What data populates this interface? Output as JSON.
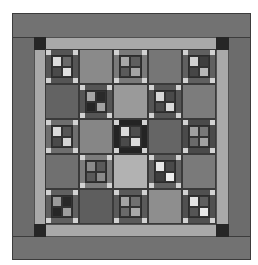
{
  "quilt": {
    "colors": {
      "outer_border": "#6f6f6f",
      "sashing": "#a9a9a9",
      "corner": "#262626",
      "corner_square": "#d2d2d2"
    },
    "blocks": [
      [
        {
          "type": "fourpatch",
          "frame": "#555555",
          "cells": [
            "#dcdcdc",
            "#6a6a6a",
            "#4a4a4a",
            "#e0e0e0"
          ]
        },
        {
          "type": "plain",
          "fill": "#8a8a8a"
        },
        {
          "type": "fourpatch",
          "frame": "#7a7a7a",
          "cells": [
            "#a8a8a8",
            "#5e5e5e",
            "#5a5a5a",
            "#a4a4a4"
          ]
        },
        {
          "type": "plain",
          "fill": "#767676"
        },
        {
          "type": "fourpatch",
          "frame": "#606060",
          "cells": [
            "#d2d2d2",
            "#3e3e3e",
            "#464646",
            "#b8b8b8"
          ]
        }
      ],
      [
        {
          "type": "plain",
          "fill": "#636363"
        },
        {
          "type": "fourpatch",
          "frame": "#555555",
          "cells": [
            "#a6a6a6",
            "#2a2a2a",
            "#262626",
            "#a2a2a2"
          ]
        },
        {
          "type": "plain",
          "fill": "#9a9a9a"
        },
        {
          "type": "fourpatch",
          "frame": "#555555",
          "cells": [
            "#d6d6d6",
            "#4a4a4a",
            "#4c4c4c",
            "#dadada"
          ]
        },
        {
          "type": "plain",
          "fill": "#7c7c7c"
        }
      ],
      [
        {
          "type": "fourpatch",
          "frame": "#6e6e6e",
          "cells": [
            "#dadada",
            "#555555",
            "#4a4a4a",
            "#d4d4d4"
          ]
        },
        {
          "type": "plain",
          "fill": "#868686"
        },
        {
          "type": "fourpatch",
          "frame": "#242424",
          "cells": [
            "#dadada",
            "#4e4e4e",
            "#4a4a4a",
            "#dcdcdc"
          ]
        },
        {
          "type": "plain",
          "fill": "#656565"
        },
        {
          "type": "fourpatch",
          "frame": "#4a4a4a",
          "cells": [
            "#a0a0a0",
            "#787878",
            "#6a6a6a",
            "#a2a2a2"
          ]
        }
      ],
      [
        {
          "type": "plain",
          "fill": "#707070"
        },
        {
          "type": "fourpatch",
          "frame": "#7c7c7c",
          "cells": [
            "#8a8a8a",
            "#5a5a5a",
            "#5a5a5a",
            "#8a8a8a"
          ]
        },
        {
          "type": "plain",
          "fill": "#b2b2b2"
        },
        {
          "type": "fourpatch",
          "frame": "#606060",
          "cells": [
            "#e6e6e6",
            "#4a4a4a",
            "#3e3e3e",
            "#eeeeee"
          ]
        },
        {
          "type": "plain",
          "fill": "#7a7a7a"
        }
      ],
      [
        {
          "type": "fourpatch",
          "frame": "#606060",
          "cells": [
            "#9a9a9a",
            "#282828",
            "#262626",
            "#9e9e9e"
          ]
        },
        {
          "type": "plain",
          "fill": "#5e5e5e"
        },
        {
          "type": "fourpatch",
          "frame": "#5a5a5a",
          "cells": [
            "#a4a4a4",
            "#707070",
            "#6a6a6a",
            "#a8a8a8"
          ]
        },
        {
          "type": "plain",
          "fill": "#8e8e8e"
        },
        {
          "type": "fourpatch",
          "frame": "#505050",
          "cells": [
            "#e4e4e4",
            "#5e5e5e",
            "#555555",
            "#e8e8e8"
          ]
        }
      ]
    ]
  }
}
